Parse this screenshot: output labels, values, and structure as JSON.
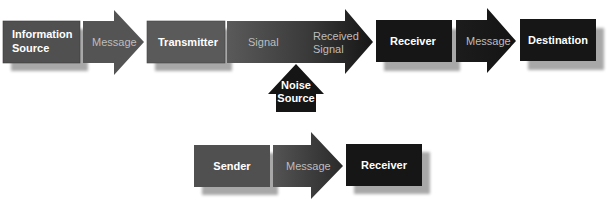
{
  "colors": {
    "source_gray": "#505050",
    "transmitter_gray": "#5a5a5a",
    "arrow_gray": "#545454",
    "receiver_black": "#161616",
    "shadow": "#a8a8a8",
    "white_text": "#ffffff",
    "light_text": "#bdbdbd"
  },
  "top_row": {
    "information_source": {
      "line1": "Information",
      "line2": "Source"
    },
    "message_1": "Message",
    "transmitter": "Transmitter",
    "signal": "Signal",
    "received_signal": {
      "line1": "Received",
      "line2": "Signal"
    },
    "receiver": "Receiver",
    "message_2": "Message",
    "destination": "Destination",
    "noise_source": {
      "line1": "Noise",
      "line2": "Source"
    }
  },
  "bottom_row": {
    "sender": "Sender",
    "message": "Message",
    "receiver": "Receiver"
  }
}
